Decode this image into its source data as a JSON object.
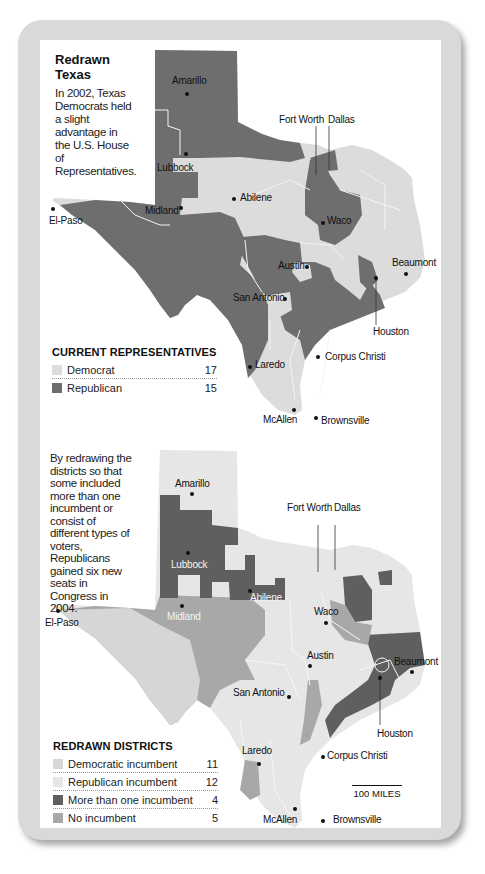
{
  "title": "Redrawn Texas",
  "intro_text": "In 2002, Texas Democrats held a slight advantage in the U.S. House of Representatives.",
  "second_text": "By redrawing the districts so that some included more than one incumbent or consist of different types of voters, Republicans gained six new seats in Congress in 2004.",
  "colors": {
    "frame": "#d9d9d9",
    "democrat": "#dcdcdc",
    "republican": "#6e6e6e",
    "dem_incumbent": "#d6d6d6",
    "rep_incumbent": "#e6e6e6",
    "multi_incumbent": "#5f5f5f",
    "no_incumbent": "#a8a8a8"
  },
  "legend_current": {
    "heading": "CURRENT REPRESENTATIVES",
    "items": [
      {
        "label": "Democrat",
        "count": "17"
      },
      {
        "label": "Republican",
        "count": "15"
      }
    ]
  },
  "legend_redrawn": {
    "heading": "REDRAWN DISTRICTS",
    "items": [
      {
        "label": "Democratic incumbent",
        "count": "11"
      },
      {
        "label": "Republican incumbent",
        "count": "12"
      },
      {
        "label": "More than one incumbent",
        "count": "4"
      },
      {
        "label": "No incumbent",
        "count": "5"
      }
    ]
  },
  "map_top": {
    "cities": {
      "amarillo": "Amarillo",
      "lubbock": "Lubbock",
      "fort_worth": "Fort Worth",
      "dallas": "Dallas",
      "abilene": "Abilene",
      "midland": "Midland",
      "el_paso": "El-Paso",
      "waco": "Waco",
      "beaumont": "Beaumont",
      "austin": "Austin",
      "san_antonio": "San Antonio",
      "houston": "Houston",
      "corpus_christi": "Corpus Christi",
      "laredo": "Laredo",
      "mcallen": "McAllen",
      "brownsville": "Brownsville"
    }
  },
  "map_bottom": {
    "cities": {
      "amarillo": "Amarillo",
      "lubbock": "Lubbock",
      "fort_worth": "Fort Worth",
      "dallas": "Dallas",
      "abilene": "Abilene",
      "midland": "Midland",
      "el_paso": "El-Paso",
      "waco": "Waco",
      "beaumont": "Beaumont",
      "austin": "Austin",
      "san_antonio": "San Antonio",
      "houston": "Houston",
      "corpus_christi": "Corpus Christi",
      "laredo": "Laredo",
      "mcallen": "McAllen",
      "brownsville": "Brownsville"
    },
    "scale_label": "100 MILES"
  }
}
